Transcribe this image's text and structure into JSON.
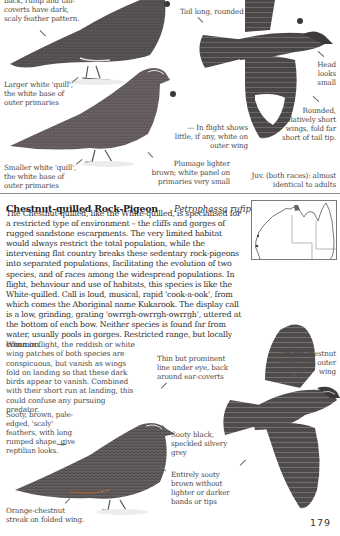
{
  "top_section": {
    "captions": {
      "back_rump": "back, rump and tail-coverts have dark, scaly feather pattern.",
      "larger_white_quill": "Larger white 'quill', the white base of outer primaries",
      "smaller_white_quill": "Smaller white 'quill', the white base of outer primaries",
      "tail_long": "Tail long, rounded",
      "head_small": "Head looks small",
      "rounded_wings": "Rounded, relatively short wings, fold far short of tail tip.",
      "in_flight": "— In flight shows little, if any, white on outer wing",
      "plumage_lighter": "Plumage lighter brown; white panel on primaries very small",
      "juv": "Juv. (both races): almost identical to adults"
    }
  },
  "species": {
    "common_name": "Chestnut-quilled Rock-Pigeon",
    "scientific_name": "Petrophassa rufipennis",
    "size": "31 cm",
    "description": "The Chestnut-quilled, like the White-quilled, is specialised for a restricted type of environment – the cliffs and gorges of rugged sandstone escarpments. The very limited habitat would always restrict the total population, while the intervening flat country breaks these sedentary rock-pigeons into separated populations, facilitating the evolution of two species, and of races among the widespread populations. In flight, behaviour and use of habitats, this species is like the White-quilled. Call is loud, musical, rapid 'cook-a-ook', from which comes the Aboriginal name Kukarook. The display call is a low, grinding, grating 'owrrgh-owrrgh-owrrgh', uttered at the bottom of each bow. Neither species is found far from water, usually pools in gorges. Restricted range, but locally common.",
    "flight_note": "When in flight, the reddish or white wing patches of both species are conspicuous, but vanish as wings fold on landing so that these dark birds appear to vanish. Combined with their short run at landing, this could confuse any pursuing predator.",
    "captions": {
      "bright_chestnut": "Bright chestnut across the outer wing",
      "thin_line": "Thin but prominent line under eye, back around ear-coverts",
      "sooty_brown": "Sooty, brown, pale-edged, 'scaly' feathers, with long rumped shape, give reptilian looks.",
      "sooty_black": "Sooty black, speckled silvery grey",
      "entirely_sooty": "Entirely sooty brown without lighter or darker bands or tips",
      "orange_chestnut": "Orange-chestnut streak on folded wing."
    }
  },
  "map": {
    "label": "distribution-map"
  },
  "page_number": "179"
}
